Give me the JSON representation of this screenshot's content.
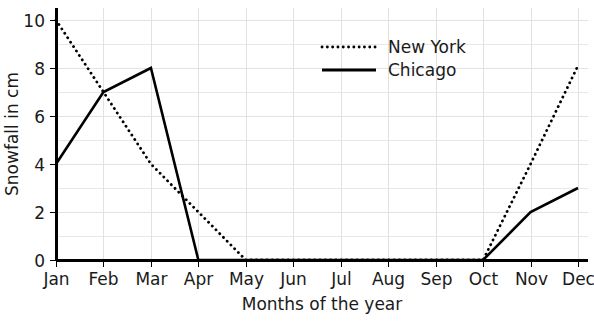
{
  "chart_data": {
    "type": "line",
    "title": "",
    "xlabel": "Months of the year",
    "ylabel": "Snowfall in cm",
    "categories": [
      "Jan",
      "Feb",
      "Mar",
      "Apr",
      "May",
      "Jun",
      "Jul",
      "Aug",
      "Sep",
      "Oct",
      "Nov",
      "Dec"
    ],
    "series": [
      {
        "name": "New York",
        "style": "dotted",
        "color": "#000000",
        "values": [
          10,
          7,
          4,
          2,
          0,
          0,
          0,
          0,
          0,
          0,
          4,
          8.1
        ]
      },
      {
        "name": "Chicago",
        "style": "solid",
        "color": "#000000",
        "values": [
          4,
          7,
          8,
          0,
          0,
          0,
          0,
          0,
          0,
          0,
          2,
          3
        ]
      }
    ],
    "ylim": [
      0,
      10.4
    ],
    "yticks": [
      0,
      2,
      4,
      6,
      8,
      10
    ],
    "ytick_labels": [
      "0",
      "2",
      "4",
      "6",
      "8",
      "10"
    ],
    "grid": true,
    "grid_minor_step": 1,
    "legend_position": "top-right",
    "legend_entries": [
      "New York",
      "Chicago"
    ]
  },
  "colors": {
    "background": "#ffffff",
    "axis": "#000000",
    "grid": "#e8e8e8",
    "text": "#1a1a1a",
    "series": "#000000"
  }
}
